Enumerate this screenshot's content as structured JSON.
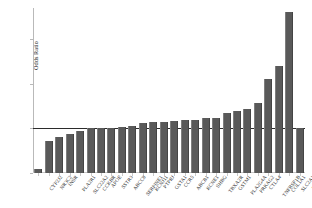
{
  "chart_data": {
    "type": "bar",
    "title": "",
    "xlabel": "",
    "ylabel": "Odds Ratio",
    "ylim": [
      0.5,
      2.35
    ],
    "yticks": [
      0.5,
      1,
      1.5,
      2
    ],
    "ytick_labels": [
      "0.5",
      "1",
      "1.5",
      "2"
    ],
    "grid": false,
    "legend": "none",
    "reference_line": {
      "value": 1,
      "orientation": "horizontal",
      "color": "#2b2b2b"
    },
    "bar_color": "#595959",
    "categories": [
      "CYP2J2",
      "NR3C2",
      "INSR",
      "PLA2R1",
      "SLC22A2",
      "CCKBR",
      "APOE",
      "SSTR3",
      "ABCC8",
      "SERPINE1",
      "KCNJ11",
      "PTPRJ",
      "GSTA1",
      "CCR5",
      "ABCB1",
      "KCNE1",
      "SHBG",
      "TBXA2R",
      "GSTM1",
      "PLA2G4A",
      "PRKAG2",
      "CTLA4",
      "TNFRSF1B",
      "COL1A1",
      "SLC2A1",
      "ABCC9"
    ],
    "values": [
      0.55,
      0.86,
      0.9,
      0.94,
      0.97,
      1.0,
      1.0,
      1.01,
      1.02,
      1.03,
      1.06,
      1.07,
      1.07,
      1.08,
      1.09,
      1.09,
      1.12,
      1.12,
      1.17,
      1.19,
      1.22,
      1.28,
      1.55,
      1.7,
      2.3,
      1.0
    ]
  }
}
